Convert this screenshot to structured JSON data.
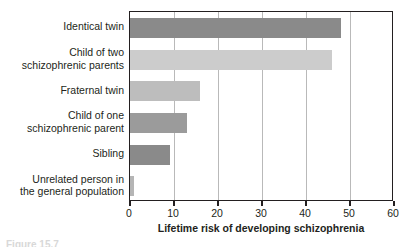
{
  "chart_data": {
    "type": "bar",
    "orientation": "horizontal",
    "title": "",
    "xlabel": "Lifetime risk of developing schizophrenia",
    "ylabel": "",
    "xlim": [
      0,
      60
    ],
    "xticks": [
      0,
      10,
      20,
      30,
      40,
      50,
      60
    ],
    "xtick_labels": [
      "0",
      "10",
      "20",
      "30",
      "40",
      "50",
      "60"
    ],
    "grid": true,
    "grid_axis": "x",
    "legend": "none",
    "categories": [
      "Identical twin",
      "Child of two\nschizophrenic parents",
      "Fraternal twin",
      "Child of one\nschizophrenic parent",
      "Sibling",
      "Unrelated person in\nthe general population"
    ],
    "values": [
      48,
      46,
      16,
      13,
      9,
      1
    ],
    "bar_colors": [
      "#8a8a8a",
      "#cccccc",
      "#bdbdbd",
      "#9b9b9b",
      "#8a8a8a",
      "#b5b5b5"
    ],
    "bars": [
      {
        "label": "Identical twin",
        "value": 48,
        "color": "#8a8a8a"
      },
      {
        "label": "Child of two schizophrenic parents",
        "value": 46,
        "color": "#cccccc"
      },
      {
        "label": "Fraternal twin",
        "value": 16,
        "color": "#bdbdbd"
      },
      {
        "label": "Child of one schizophrenic parent",
        "value": 13,
        "color": "#9b9b9b"
      },
      {
        "label": "Sibling",
        "value": 9,
        "color": "#8a8a8a"
      },
      {
        "label": "Unrelated person in the general population",
        "value": 1,
        "color": "#b5b5b5"
      }
    ]
  },
  "axis": {
    "x_title": "Lifetime risk of developing schizophrenia",
    "ticks": [
      {
        "value": 0,
        "label": "0"
      },
      {
        "value": 10,
        "label": "10"
      },
      {
        "value": 20,
        "label": "20"
      },
      {
        "value": 30,
        "label": "30"
      },
      {
        "value": 40,
        "label": "40"
      },
      {
        "value": 50,
        "label": "50"
      },
      {
        "value": 60,
        "label": "60"
      }
    ]
  },
  "labels": {
    "cat0": "Identical twin",
    "cat1": "Child of two\nschizophrenic parents",
    "cat2": "Fraternal twin",
    "cat3": "Child of one\nschizophrenic parent",
    "cat4": "Sibling",
    "cat5": "Unrelated person in\nthe general population"
  },
  "caption": {
    "text": "Figure 15.7"
  },
  "colors": {
    "frame": "#231f20",
    "gridline": "#b9b9b9",
    "text": "#231f20",
    "background": "#ffffff"
  }
}
